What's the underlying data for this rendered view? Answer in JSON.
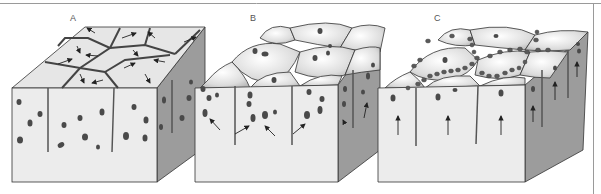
{
  "figure": {
    "panels": [
      {
        "label": "A",
        "description": "Polygonal cell block, arrows on top surface pointing outward within cells; nuclei scattered in front face"
      },
      {
        "label": "B",
        "description": "Domed cell surfaces with nuclei migrating upward; arrows in front face converge toward cell boundaries"
      },
      {
        "label": "C",
        "description": "Domed cells with nuclei aligned along cell boundaries on top; vertical arrows pointing upward in front face"
      }
    ],
    "colors": {
      "front_face": "#ececec",
      "side_face": "#9c9c9c",
      "top_face": "#e4e4e4",
      "outline": "#333333",
      "nucleus": "#4a4a4a",
      "frame": "#9a9a9a"
    }
  }
}
